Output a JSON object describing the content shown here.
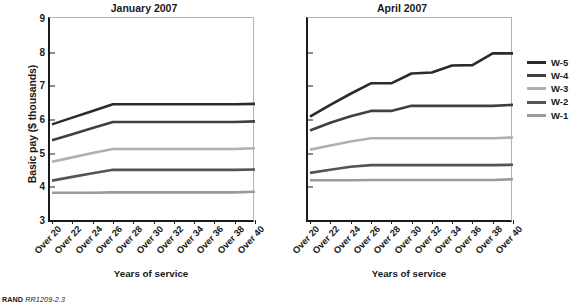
{
  "figure": {
    "ylabel": "Basic pay ($ thousands)",
    "xlabel_left": "Years of service",
    "xlabel_right": "Years of service",
    "footnote_brand": "RAND",
    "footnote_id": "RR1209-2.3"
  },
  "legend": {
    "position": "right",
    "items": [
      {
        "label": "W-5",
        "color": "#2b2b2b"
      },
      {
        "label": "W-4",
        "color": "#404040"
      },
      {
        "label": "W-3",
        "color": "#b0b0b0"
      },
      {
        "label": "W-2",
        "color": "#545454"
      },
      {
        "label": "W-1",
        "color": "#9a9a9a"
      }
    ]
  },
  "chart_data": [
    {
      "type": "line",
      "title": "January 2007",
      "xlabel": "Years of service",
      "ylabel": "Basic pay ($ thousands)",
      "categories": [
        "Over 20",
        "Over 22",
        "Over 24",
        "Over 26",
        "Over 28",
        "Over 30",
        "Over 32",
        "Over 34",
        "Over 36",
        "Over 38",
        "Over 40"
      ],
      "x": [
        20,
        22,
        24,
        26,
        28,
        30,
        32,
        34,
        36,
        38,
        40
      ],
      "ylim": [
        3,
        9
      ],
      "yticks": [
        3,
        4,
        5,
        6,
        7,
        8,
        9
      ],
      "grid": false,
      "series": [
        {
          "name": "W-5",
          "color": "#2b2b2b",
          "values": [
            5.87,
            6.07,
            6.27,
            6.47,
            6.47,
            6.47,
            6.47,
            6.47,
            6.47,
            6.47,
            6.48
          ]
        },
        {
          "name": "W-4",
          "color": "#404040",
          "values": [
            5.4,
            5.58,
            5.76,
            5.94,
            5.94,
            5.94,
            5.94,
            5.94,
            5.94,
            5.94,
            5.96
          ]
        },
        {
          "name": "W-3",
          "color": "#b0b0b0",
          "values": [
            4.76,
            4.89,
            5.02,
            5.14,
            5.14,
            5.14,
            5.14,
            5.14,
            5.14,
            5.14,
            5.16
          ]
        },
        {
          "name": "W-2",
          "color": "#545454",
          "values": [
            4.2,
            4.31,
            4.42,
            4.52,
            4.52,
            4.52,
            4.52,
            4.52,
            4.52,
            4.52,
            4.53
          ]
        },
        {
          "name": "W-1",
          "color": "#9a9a9a",
          "values": [
            3.84,
            3.84,
            3.84,
            3.85,
            3.85,
            3.85,
            3.85,
            3.85,
            3.85,
            3.85,
            3.87
          ]
        }
      ]
    },
    {
      "type": "line",
      "title": "April 2007",
      "xlabel": "Years of service",
      "ylabel": "Basic pay ($ thousands)",
      "categories": [
        "Over 20",
        "Over 22",
        "Over 24",
        "Over 26",
        "Over 28",
        "Over 30",
        "Over 32",
        "Over 34",
        "Over 36",
        "Over 38",
        "Over 40"
      ],
      "x": [
        20,
        22,
        24,
        26,
        28,
        30,
        32,
        34,
        36,
        38,
        40
      ],
      "ylim": [
        3,
        9
      ],
      "yticks": [
        3,
        4,
        5,
        6,
        7,
        8,
        9
      ],
      "grid": false,
      "series": [
        {
          "name": "W-5",
          "color": "#2b2b2b",
          "values": [
            6.1,
            6.45,
            6.78,
            7.09,
            7.09,
            7.38,
            7.41,
            7.62,
            7.63,
            7.98,
            7.98
          ]
        },
        {
          "name": "W-4",
          "color": "#404040",
          "values": [
            5.69,
            5.92,
            6.11,
            6.27,
            6.27,
            6.42,
            6.42,
            6.42,
            6.42,
            6.42,
            6.45
          ]
        },
        {
          "name": "W-3",
          "color": "#b0b0b0",
          "values": [
            5.12,
            5.24,
            5.36,
            5.46,
            5.46,
            5.46,
            5.46,
            5.46,
            5.46,
            5.46,
            5.48
          ]
        },
        {
          "name": "W-2",
          "color": "#545454",
          "values": [
            4.43,
            4.52,
            4.61,
            4.66,
            4.66,
            4.66,
            4.66,
            4.66,
            4.66,
            4.66,
            4.67
          ]
        },
        {
          "name": "W-1",
          "color": "#9a9a9a",
          "values": [
            4.21,
            4.21,
            4.21,
            4.22,
            4.22,
            4.22,
            4.22,
            4.22,
            4.22,
            4.22,
            4.24
          ]
        }
      ]
    }
  ]
}
